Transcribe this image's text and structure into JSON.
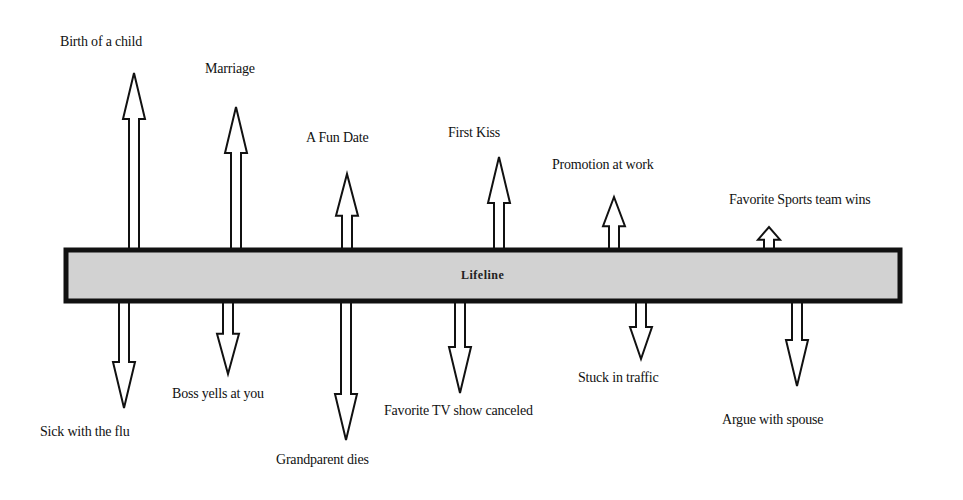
{
  "diagram": {
    "type": "lifeline",
    "bar": {
      "label": "Lifeline",
      "x": 66,
      "y": 250,
      "width": 834,
      "height": 51,
      "fill": "#d2d2d2",
      "stroke": "#111111"
    },
    "positive_events": [
      {
        "label": "Birth of a child",
        "x": 134,
        "tip_y": 73,
        "label_x": 60,
        "label_y": 34
      },
      {
        "label": "Marriage",
        "x": 236,
        "tip_y": 107,
        "label_x": 205,
        "label_y": 61
      },
      {
        "label": "A Fun Date",
        "x": 347,
        "tip_y": 174,
        "label_x": 306,
        "label_y": 130
      },
      {
        "label": "First Kiss",
        "x": 499,
        "tip_y": 157,
        "label_x": 448,
        "label_y": 125
      },
      {
        "label": "Promotion at work",
        "x": 614,
        "tip_y": 197,
        "label_x": 552,
        "label_y": 157
      },
      {
        "label": "Favorite Sports team wins",
        "x": 769,
        "tip_y": 227,
        "label_x": 729,
        "label_y": 192
      }
    ],
    "negative_events": [
      {
        "label": "Sick with the flu",
        "x": 124,
        "tip_y": 408,
        "label_x": 40,
        "label_y": 424
      },
      {
        "label": "Boss yells at you",
        "x": 228,
        "tip_y": 374,
        "label_x": 172,
        "label_y": 386
      },
      {
        "label": "Grandparent dies",
        "x": 346,
        "tip_y": 440,
        "label_x": 276,
        "label_y": 452
      },
      {
        "label": "Favorite TV show canceled",
        "x": 460,
        "tip_y": 393,
        "label_x": 384,
        "label_y": 403
      },
      {
        "label": "Stuck in traffic",
        "x": 641,
        "tip_y": 359,
        "label_x": 578,
        "label_y": 370
      },
      {
        "label": "Argue with spouse",
        "x": 797,
        "tip_y": 386,
        "label_x": 722,
        "label_y": 412
      }
    ],
    "colors": {
      "background": "#ffffff",
      "stroke": "#111111",
      "bar_fill": "#d2d2d2",
      "text": "#111111"
    }
  }
}
